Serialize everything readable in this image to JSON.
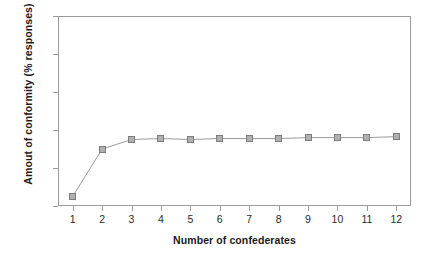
{
  "chart_data": {
    "type": "line",
    "title": "",
    "subtitle": "",
    "xlabel": "Number of confederates",
    "ylabel": "Amout of conformity (% responses)",
    "x": [
      1,
      2,
      3,
      4,
      5,
      6,
      7,
      8,
      9,
      10,
      11,
      12
    ],
    "categories": [
      "1",
      "2",
      "3",
      "4",
      "5",
      "6",
      "7",
      "8",
      "9",
      "10",
      "11",
      "12"
    ],
    "values": [
      5,
      30,
      35,
      35.5,
      35,
      35.5,
      35.5,
      35.5,
      36,
      36,
      36,
      36.5
    ],
    "series": [
      {
        "name": "Amount of conformity",
        "values": [
          5,
          30,
          35,
          35.5,
          35,
          35.5,
          35.5,
          35.5,
          36,
          36,
          36,
          36.5
        ]
      }
    ],
    "xlim": [
      0.5,
      12.5
    ],
    "ylim": [
      0,
      100
    ],
    "yticks": [
      0,
      20,
      40,
      60,
      80,
      100
    ],
    "ytick_labels": [
      "0",
      "20",
      "40",
      "60",
      "80",
      "100"
    ],
    "xticks": [
      1,
      2,
      3,
      4,
      5,
      6,
      7,
      8,
      9,
      10,
      11,
      12
    ],
    "xtick_labels": [
      "1",
      "2",
      "3",
      "4",
      "5",
      "6",
      "7",
      "8",
      "9",
      "10",
      "11",
      "12"
    ],
    "grid": false,
    "legend": false,
    "legend_position": "none",
    "marker": "square",
    "marker_fill_color": "#b0b0b0",
    "marker_edge_color": "#7d7d7d",
    "line_color": "#9a9a9a",
    "axis_color": "#9a9a9a",
    "background_color": "#ffffff",
    "text_color": "#1b1b1b"
  }
}
